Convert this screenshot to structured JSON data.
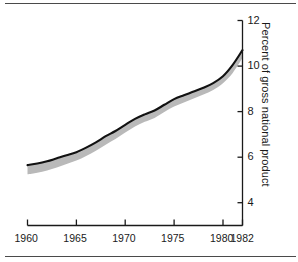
{
  "chart_data": {
    "type": "line",
    "title": "",
    "subtitle": "",
    "xlabel": "",
    "ylabel": "Percent of gross national product",
    "xlim": [
      1960,
      1982
    ],
    "ylim": [
      3.0,
      12.0
    ],
    "grid": false,
    "legend": null,
    "annotations": [],
    "x_ticks": [
      1960,
      1965,
      1970,
      1975,
      1980,
      1982
    ],
    "x_tick_labels": [
      "1960",
      "1965",
      "1970",
      "1975",
      "1980",
      "1982"
    ],
    "y_ticks": [
      4,
      6,
      8,
      10,
      12
    ],
    "y_tick_labels": [
      "4",
      "6",
      "8",
      "10",
      "12"
    ],
    "y_axis_side": "right",
    "x": [
      1960,
      1961,
      1962,
      1963,
      1964,
      1965,
      1966,
      1967,
      1968,
      1969,
      1970,
      1971,
      1972,
      1973,
      1974,
      1975,
      1976,
      1977,
      1978,
      1979,
      1980,
      1981,
      1982
    ],
    "series": [
      {
        "name": "Upper bound",
        "style": "solid-black-line",
        "values": [
          5.65,
          5.72,
          5.82,
          5.95,
          6.08,
          6.22,
          6.42,
          6.65,
          6.92,
          7.15,
          7.42,
          7.68,
          7.88,
          8.05,
          8.3,
          8.55,
          8.72,
          8.88,
          9.05,
          9.25,
          9.55,
          10.05,
          10.7
        ]
      },
      {
        "name": "Lower bound",
        "style": "gray-band",
        "values": [
          5.25,
          5.32,
          5.42,
          5.55,
          5.7,
          5.85,
          6.05,
          6.28,
          6.55,
          6.8,
          7.08,
          7.35,
          7.55,
          7.72,
          7.98,
          8.22,
          8.4,
          8.58,
          8.75,
          8.95,
          9.25,
          9.7,
          10.35
        ]
      }
    ],
    "band_color": "#b9b9b9",
    "line_color": "#111111"
  },
  "axis": {
    "y_title": "Percent of gross national product",
    "ticks_y": [
      "12",
      "10",
      "8",
      "6",
      "4"
    ],
    "ticks_x": [
      "1960",
      "1965",
      "1970",
      "1975",
      "1980",
      "1982"
    ]
  },
  "colors": {
    "line": "#111111",
    "band": "#b9b9b9",
    "axis": "#1a1a1a",
    "rule": "#4a4a4a",
    "background": "#ffffff"
  }
}
